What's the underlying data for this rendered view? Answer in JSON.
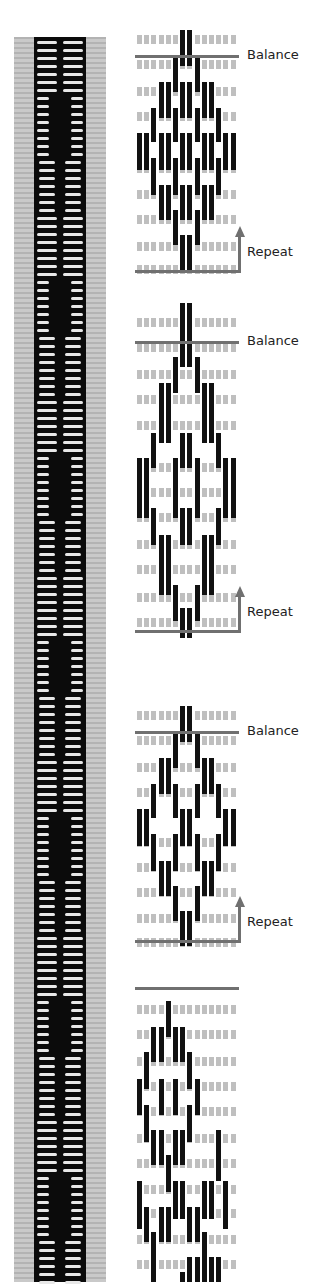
{
  "labels": {
    "balance": "Balance",
    "repeat": "Repeat"
  },
  "colors": {
    "thread_dark": "#111111",
    "thread_light": "#bfbfbf",
    "guide_line": "#707070",
    "band_edge": "#c2c2c2"
  },
  "grid": {
    "columns": 14,
    "col_pitch": 7.2
  },
  "diagrams": [
    {
      "top": 30,
      "height": 248,
      "balance_y": 25,
      "repeat_y": 240,
      "row_ys": [
        5,
        30,
        57,
        82,
        134,
        160,
        185,
        212,
        235
      ],
      "blacks": [
        [
          6,
          0,
          36
        ],
        [
          7,
          0,
          36
        ],
        [
          5,
          28,
          62
        ],
        [
          8,
          28,
          62
        ],
        [
          4,
          52,
          88
        ],
        [
          9,
          52,
          88
        ],
        [
          3,
          52,
          88
        ],
        [
          10,
          52,
          88
        ],
        [
          6,
          52,
          88
        ],
        [
          7,
          52,
          88
        ],
        [
          2,
          78,
          112
        ],
        [
          11,
          78,
          112
        ],
        [
          5,
          78,
          112
        ],
        [
          8,
          78,
          112
        ],
        [
          0,
          103,
          140
        ],
        [
          1,
          103,
          140
        ],
        [
          12,
          103,
          140
        ],
        [
          13,
          103,
          140
        ],
        [
          3,
          103,
          140
        ],
        [
          4,
          103,
          140
        ],
        [
          9,
          103,
          140
        ],
        [
          10,
          103,
          140
        ],
        [
          6,
          103,
          140
        ],
        [
          7,
          103,
          140
        ],
        [
          2,
          128,
          165
        ],
        [
          11,
          128,
          165
        ],
        [
          5,
          128,
          165
        ],
        [
          8,
          128,
          165
        ],
        [
          3,
          155,
          190
        ],
        [
          4,
          155,
          190
        ],
        [
          9,
          155,
          190
        ],
        [
          10,
          155,
          190
        ],
        [
          6,
          155,
          190
        ],
        [
          7,
          155,
          190
        ],
        [
          5,
          180,
          215
        ],
        [
          8,
          180,
          215
        ],
        [
          6,
          205,
          242
        ],
        [
          7,
          205,
          242
        ]
      ],
      "labels": {
        "balance_x": 110,
        "repeat_x": 110
      }
    },
    {
      "top": 303,
      "height": 335,
      "balance_y": 38,
      "repeat_y": 327,
      "row_ys": [
        15,
        40,
        67,
        92,
        118,
        160,
        185,
        210,
        237,
        262,
        290,
        315
      ],
      "blacks": [
        [
          6,
          0,
          64
        ],
        [
          7,
          0,
          64
        ],
        [
          5,
          54,
          90
        ],
        [
          8,
          54,
          90
        ],
        [
          3,
          80,
          140
        ],
        [
          4,
          80,
          140
        ],
        [
          9,
          80,
          140
        ],
        [
          10,
          80,
          140
        ],
        [
          2,
          130,
          165
        ],
        [
          11,
          130,
          165
        ],
        [
          6,
          130,
          165
        ],
        [
          7,
          130,
          165
        ],
        [
          0,
          155,
          215
        ],
        [
          1,
          155,
          215
        ],
        [
          12,
          155,
          215
        ],
        [
          13,
          155,
          215
        ],
        [
          5,
          155,
          215
        ],
        [
          8,
          155,
          215
        ],
        [
          2,
          205,
          242
        ],
        [
          11,
          205,
          242
        ],
        [
          6,
          205,
          242
        ],
        [
          7,
          205,
          242
        ],
        [
          3,
          232,
          292
        ],
        [
          4,
          232,
          292
        ],
        [
          9,
          232,
          292
        ],
        [
          10,
          232,
          292
        ],
        [
          5,
          282,
          318
        ],
        [
          8,
          282,
          318
        ],
        [
          6,
          305,
          335
        ],
        [
          7,
          305,
          335
        ]
      ],
      "labels": {
        "balance_x": 110,
        "repeat_x": 110
      }
    },
    {
      "top": 706,
      "height": 240,
      "balance_y": 25,
      "repeat_y": 234,
      "row_ys": [
        5,
        30,
        57,
        82,
        132,
        157,
        182,
        208,
        232
      ],
      "blacks": [
        [
          6,
          0,
          36
        ],
        [
          7,
          0,
          36
        ],
        [
          5,
          28,
          62
        ],
        [
          8,
          28,
          62
        ],
        [
          3,
          52,
          88
        ],
        [
          4,
          52,
          88
        ],
        [
          9,
          52,
          88
        ],
        [
          10,
          52,
          88
        ],
        [
          2,
          78,
          112
        ],
        [
          11,
          78,
          112
        ],
        [
          5,
          78,
          112
        ],
        [
          8,
          78,
          112
        ],
        [
          0,
          103,
          140
        ],
        [
          1,
          103,
          140
        ],
        [
          12,
          103,
          140
        ],
        [
          13,
          103,
          140
        ],
        [
          6,
          103,
          140
        ],
        [
          7,
          103,
          140
        ],
        [
          2,
          128,
          165
        ],
        [
          11,
          128,
          165
        ],
        [
          5,
          128,
          165
        ],
        [
          8,
          128,
          165
        ],
        [
          3,
          155,
          190
        ],
        [
          4,
          155,
          190
        ],
        [
          9,
          155,
          190
        ],
        [
          10,
          155,
          190
        ],
        [
          5,
          180,
          215
        ],
        [
          8,
          180,
          215
        ],
        [
          6,
          205,
          240
        ],
        [
          7,
          205,
          240
        ]
      ],
      "labels": {
        "balance_x": 110,
        "repeat_x": 110
      }
    },
    {
      "top": 987,
      "height": 295,
      "balance_y": 0,
      "repeat_y": null,
      "row_ys": [
        18,
        43,
        70,
        95,
        120,
        147,
        172,
        198,
        222,
        248,
        273
      ],
      "blacks": [
        [
          4,
          14,
          50
        ],
        [
          2,
          40,
          75
        ],
        [
          3,
          40,
          75
        ],
        [
          5,
          40,
          75
        ],
        [
          6,
          40,
          75
        ],
        [
          1,
          65,
          102
        ],
        [
          7,
          65,
          102
        ],
        [
          0,
          92,
          128
        ],
        [
          3,
          92,
          128
        ],
        [
          5,
          92,
          128
        ],
        [
          8,
          92,
          128
        ],
        [
          1,
          118,
          155
        ],
        [
          7,
          118,
          155
        ],
        [
          2,
          143,
          178
        ],
        [
          3,
          143,
          178
        ],
        [
          5,
          143,
          178
        ],
        [
          6,
          143,
          178
        ],
        [
          11,
          143,
          194
        ],
        [
          4,
          168,
          205
        ],
        [
          0,
          194,
          242
        ],
        [
          5,
          194,
          232
        ],
        [
          6,
          194,
          232
        ],
        [
          9,
          194,
          232
        ],
        [
          10,
          194,
          232
        ],
        [
          12,
          194,
          242
        ],
        [
          1,
          220,
          255
        ],
        [
          3,
          220,
          255
        ],
        [
          4,
          220,
          255
        ],
        [
          7,
          220,
          255
        ],
        [
          8,
          220,
          255
        ],
        [
          2,
          245,
          295
        ],
        [
          9,
          245,
          295
        ],
        [
          7,
          270,
          295
        ],
        [
          8,
          270,
          295
        ],
        [
          10,
          270,
          295
        ],
        [
          11,
          270,
          295
        ],
        [
          6,
          285,
          295
        ]
      ],
      "labels": {}
    }
  ]
}
